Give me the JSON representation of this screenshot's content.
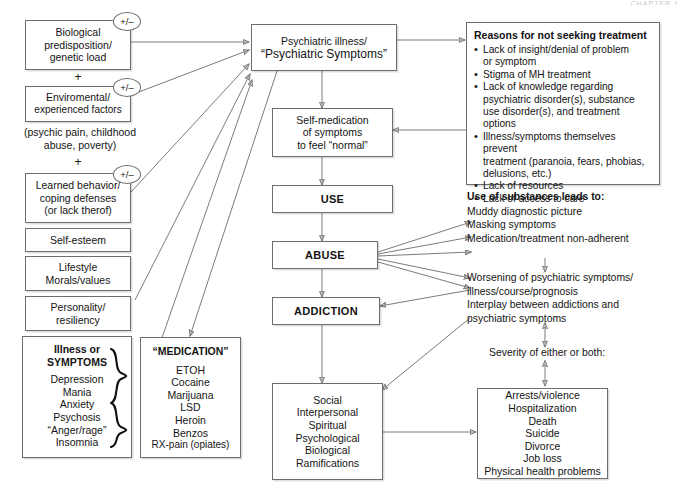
{
  "diagram": {
    "corner_note": "CHAPTER 1",
    "modifier_symbol": "+/–",
    "plus_symbol": "+",
    "left_column": {
      "factor_boxes": [
        {
          "id": "biological",
          "lines": [
            "Biological",
            "predisposition/",
            "genetic load"
          ]
        },
        {
          "id": "environmental",
          "lines": [
            "Enviromental/",
            "experienced factors"
          ]
        },
        {
          "id": "learned-behavior",
          "lines": [
            "Learned behavior/",
            "coping defenses",
            "(or lack therof)"
          ]
        }
      ],
      "environment_note": [
        "(psychic pain, childhood",
        "abuse, poverty)"
      ],
      "trait_boxes": [
        {
          "id": "self-esteem",
          "lines": [
            "Self-esteem"
          ]
        },
        {
          "id": "lifestyle",
          "lines": [
            "Lifestyle",
            "Morals/values"
          ]
        },
        {
          "id": "personality",
          "lines": [
            "Personality/",
            "resiliency"
          ]
        }
      ],
      "symptoms_box": {
        "title_lines": [
          "Illness or",
          "SYMPTOMS"
        ],
        "items": [
          "Depression",
          "Mania",
          "Anxiety",
          "Psychosis",
          "“Anger/rage”",
          "Insomnia"
        ]
      },
      "medication_box": {
        "title": "“MEDICATION”",
        "items": [
          "ETOH",
          "Cocaine",
          "Marijuana",
          "LSD",
          "Heroin",
          "Benzos",
          "RX-pain (opiates)"
        ]
      }
    },
    "center_column": {
      "psychiatric_illness": {
        "lines": [
          "Psychiatric illness/",
          "“Psychiatric Symptoms”"
        ]
      },
      "self_medication": {
        "lines": [
          "Self-medication",
          "of symptoms",
          "to feel “normal”"
        ]
      },
      "use": {
        "label": "USE"
      },
      "abuse": {
        "label": "ABUSE"
      },
      "addiction": {
        "label": "ADDICTION"
      },
      "ramifications": {
        "lines": [
          "Social",
          "Interpersonal",
          "Spiritual",
          "Psychological",
          "Biological",
          "Ramifications"
        ]
      }
    },
    "right_column": {
      "reasons_panel": {
        "title": "Reasons for not seeking treatment",
        "items": [
          [
            "Lack of insight/denial of problem",
            "or symptom"
          ],
          [
            "Stigma of MH treatment"
          ],
          [
            "Lack of knowledge regarding",
            "psychiatric disorder(s), substance",
            "use disorder(s), and treatment options"
          ],
          [
            "Illness/symptoms themselves prevent",
            "treatment (paranoia, fears, phobias,",
            "delusions, etc.)"
          ],
          [
            "Lack of resources"
          ],
          [
            "Lack of access to care"
          ]
        ]
      },
      "substances_lead_to": {
        "heading": "Use of substances leads to:",
        "items": [
          "Muddy diagnostic picture",
          "Masking symptoms",
          "Medication/treatment non-adherent"
        ]
      },
      "worsening": [
        "Worsening of psychiatric symptoms/",
        "illness/course/prognosis"
      ],
      "interplay": [
        "Interplay between addictions and",
        "psychiatric symptoms"
      ],
      "severity_label": "Severity of either or both:",
      "outcomes_box": {
        "items": [
          "Arrests/violence",
          "Hospitalization",
          "Death",
          "Suicide",
          "Divorce",
          "Job loss",
          "Physical health problems"
        ]
      }
    }
  }
}
